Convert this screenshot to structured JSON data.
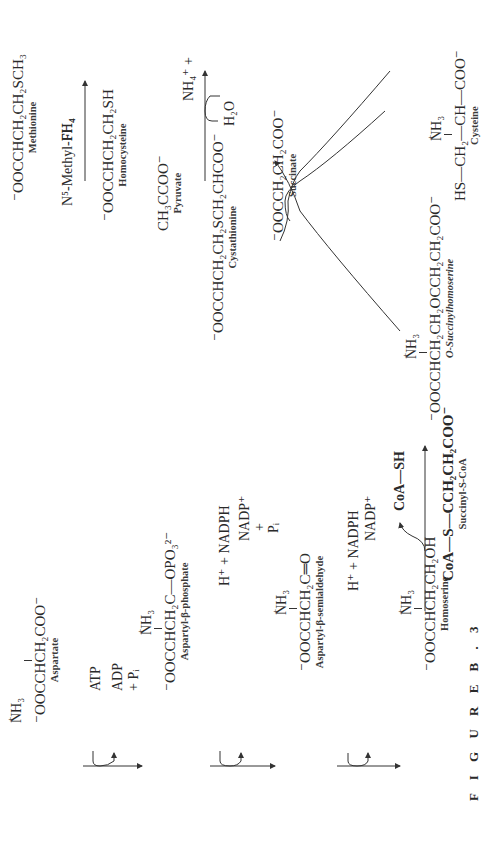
{
  "figure_label": "F I G U R E  B . 3",
  "compounds": {
    "aspartate": {
      "formula": "⁻OOCCHCH₂COO⁻",
      "substituent": "NH₃",
      "name": "Aspartate"
    },
    "aspartyl_phosphate": {
      "formula": "⁻OOCCHCH₂C—OPO₃²⁻",
      "substituent": "NH₃",
      "carbonyl": "O",
      "name": "Aspartyl-β-phosphate"
    },
    "aspartyl_semialdehyde": {
      "formula": "⁻OOCCHCH₂C═O",
      "substituent": "NH₃",
      "aldehyde_h": "H",
      "name": "Aspartyl-β-semialdehyde"
    },
    "homoserine": {
      "formula": "⁻OOCCHCH₂CH₂OH",
      "substituent": "NH₃",
      "name": "Homoserine"
    },
    "o_succinylhomoserine": {
      "formula": "⁻OOCCHCH₂CH₂OCCH₂CH₂COO⁻",
      "substituent": "NH₃",
      "carbonyl": "O",
      "name": "O-Succinylhomoserine"
    },
    "succinyl_coa": {
      "formula": "CoA—S—CCH₂CH₂COO⁻",
      "carbonyl": "O",
      "name": "Succinyl-S-CoA"
    },
    "coa_sh": {
      "formula": "CoA—SH"
    },
    "cystathionine": {
      "formula": "⁻OOCCHCH₂CH₂SCH₂CHCOO⁻",
      "substituent": "NH₃",
      "name": "Cystathionine"
    },
    "cysteine": {
      "formula": "HS—CH₂—CH—COO⁻",
      "substituent": "NH₃",
      "name": "Cysteine"
    },
    "succinate": {
      "formula": "⁻OOCCH₂CH₂COO⁻",
      "name": "Succinate"
    },
    "homocysteine": {
      "formula": "⁻OOCCHCH₂CH₂SH",
      "substituent": "NH₃",
      "name": "Homocysteine"
    },
    "methionine": {
      "formula": "⁻OOCCHCH₂CH₂SCH₃",
      "substituent": "NH₃",
      "name": "Methionine"
    },
    "pyruvate": {
      "formula": "CH₃CCOO⁻",
      "carbonyl": "O",
      "name": "Pyruvate"
    }
  },
  "cofactors": {
    "step1_in": "ATP",
    "step1_out_a": "ADP",
    "step1_out_b": "+ Pᵢ",
    "step2_in": "H⁺ + NADPH",
    "step2_out_a": "NADP⁺",
    "step2_out_b": "+",
    "step2_out_c": "Pᵢ",
    "step3_in": "H⁺ + NADPH",
    "step3_out": "NADP⁺",
    "step6_in": "H₂O",
    "step6_out": "NH₄⁺  +",
    "step7_in": "N⁵-Methyl-FH₄",
    "step7_out": "FH₄"
  }
}
